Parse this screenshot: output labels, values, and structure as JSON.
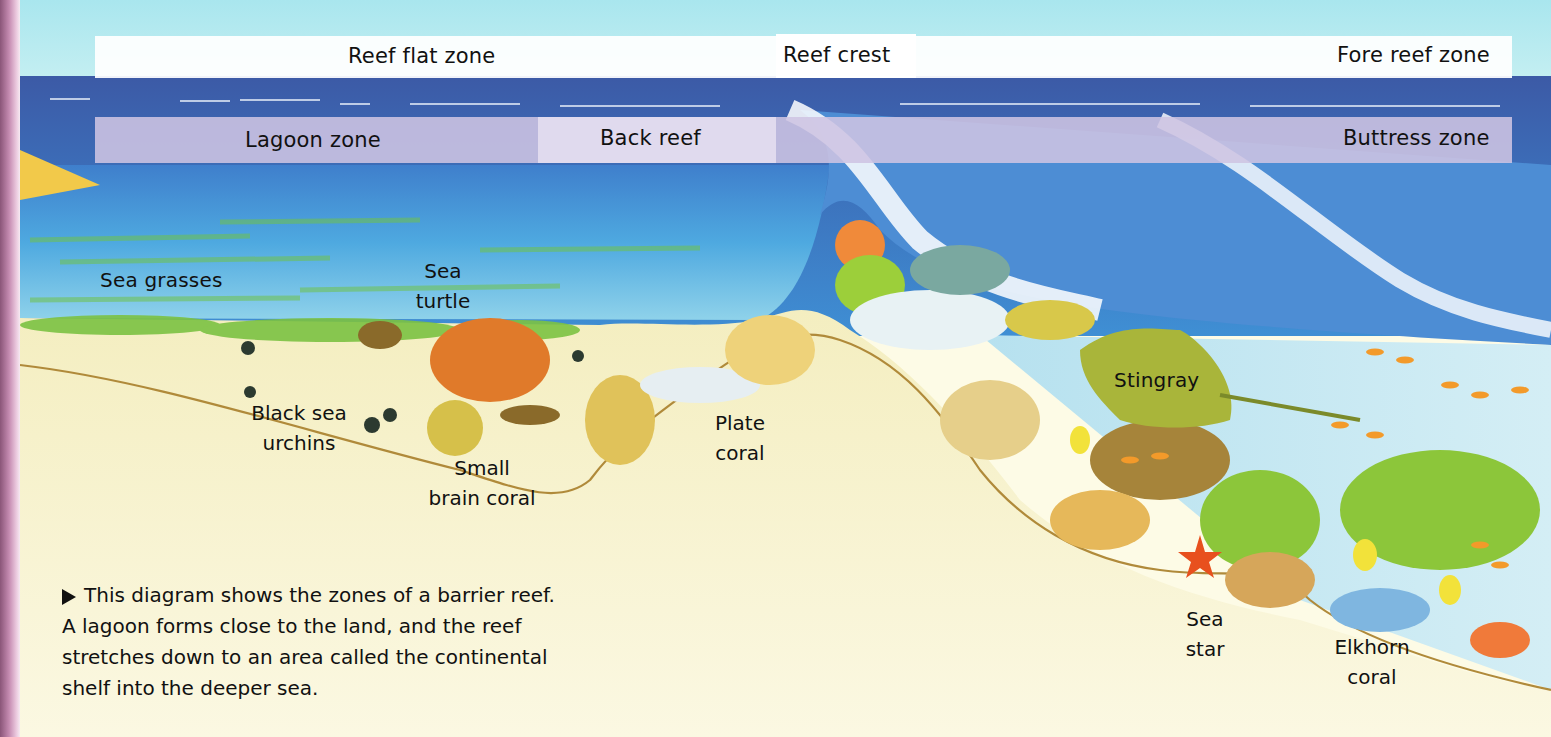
{
  "zones_top": {
    "reef_flat": "Reef flat zone",
    "reef_crest": "Reef crest",
    "fore_reef": "Fore reef zone"
  },
  "zones_bottom": {
    "lagoon": "Lagoon zone",
    "back_reef": "Back reef",
    "buttress": "Buttress zone"
  },
  "labels": {
    "sea_grasses": "Sea grasses",
    "sea_turtle_1": "Sea",
    "sea_turtle_2": "turtle",
    "urchins_1": "Black sea",
    "urchins_2": "urchins",
    "brain_coral_1": "Small",
    "brain_coral_2": "brain coral",
    "plate_coral_1": "Plate",
    "plate_coral_2": "coral",
    "stingray": "Stingray",
    "sea_star_1": "Sea",
    "sea_star_2": "star",
    "elkhorn_1": "Elkhorn",
    "elkhorn_2": "coral"
  },
  "caption": {
    "line1": "This diagram shows the zones of a barrier reef.",
    "line2": "A lagoon forms close to the land, and the reef",
    "line3": "stretches down to an area called the continental",
    "line4": "shelf into the deeper sea."
  },
  "colors": {
    "sky": "#b8ecf0",
    "deep_sea": "#3f5ea8",
    "lagoon_water": "#4aa6dc",
    "sand": "#f6f2c8",
    "seagrass": "#7cc243",
    "turtle_shell": "#e07a2a",
    "stingray": "#a9b53a"
  }
}
